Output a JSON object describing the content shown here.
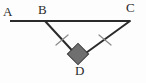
{
  "figure": {
    "kind": "geometry-diagram",
    "background_color": "#fdfdfd",
    "stroke_color": "#2b2b2b",
    "tick_color": "#8a8a8a",
    "marker_fill_color": "#6f6f6f",
    "marker_stroke_color": "#3a3a3a",
    "label_color": "#2b2b2b",
    "points": [
      {
        "name": "A",
        "label": "A",
        "x": 10,
        "y": 21,
        "label_x": 3,
        "label_y": 5
      },
      {
        "name": "B",
        "label": "B",
        "x": 45,
        "y": 21,
        "label_x": 38,
        "label_y": 3
      },
      {
        "name": "C",
        "label": "C",
        "x": 130,
        "y": 21,
        "label_x": 126,
        "label_y": 1
      },
      {
        "name": "D",
        "label": "D",
        "x": 79,
        "y": 58,
        "label_x": 75,
        "label_y": 64
      }
    ],
    "segments": [
      {
        "name": "segment-AC",
        "from": "A",
        "to": "C",
        "x1": 10,
        "y1": 21,
        "x2": 130,
        "y2": 21,
        "width": 2.0
      },
      {
        "name": "segment-BD",
        "from": "B",
        "to": "D",
        "x1": 45,
        "y1": 21,
        "x2": 79,
        "y2": 58,
        "width": 2.0
      },
      {
        "name": "segment-CD",
        "from": "C",
        "to": "D",
        "x1": 130,
        "y1": 21,
        "x2": 79,
        "y2": 58,
        "width": 2.0
      }
    ],
    "tick_marks": [
      {
        "name": "tick-mark-BD",
        "on_segment": "segment-BD",
        "count": 1,
        "x1": 56,
        "y1": 45,
        "x2": 68,
        "y2": 35,
        "width": 1.2
      },
      {
        "name": "tick-mark-CD",
        "on_segment": "segment-CD",
        "count": 1,
        "x1": 99,
        "y1": 35,
        "x2": 111,
        "y2": 45,
        "width": 1.2
      }
    ],
    "angle_marker": {
      "name": "right-angle-marker-D",
      "at_point": "D",
      "shape": "filled-square",
      "rotation_deg": 45,
      "center_x": 78,
      "center_y": 54,
      "size": 15
    }
  }
}
